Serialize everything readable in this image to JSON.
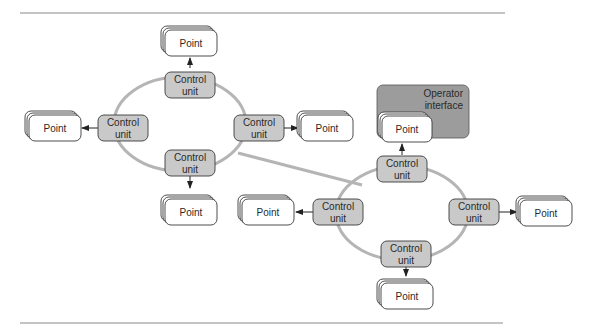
{
  "diagram": {
    "type": "network-topology",
    "control_unit_label_line1": "Control",
    "control_unit_label_line2": "unit",
    "point_label": "Point",
    "operator_interface_line1": "Operator",
    "operator_interface_line2": "interface",
    "colors": {
      "control_unit_fill": "#c9c9c9",
      "ring": "#b5b5b5",
      "operator_interface_fill": "#9c9c9c",
      "point_fill": "#ffffff",
      "outline": "#3a3a3a"
    },
    "rings": [
      {
        "id": "ring-left",
        "nodes": [
          {
            "id": "cu-left-top",
            "position": "top",
            "point_direction": "up"
          },
          {
            "id": "cu-left-left",
            "position": "left",
            "point_direction": "left"
          },
          {
            "id": "cu-left-right",
            "position": "right",
            "point_direction": "right"
          },
          {
            "id": "cu-left-bottom",
            "position": "bottom",
            "point_direction": "down"
          }
        ]
      },
      {
        "id": "ring-right",
        "nodes": [
          {
            "id": "cu-right-top",
            "position": "top",
            "point_direction": "up",
            "point_in_operator_interface": true
          },
          {
            "id": "cu-right-left",
            "position": "left",
            "point_direction": "left"
          },
          {
            "id": "cu-right-right",
            "position": "right",
            "point_direction": "right"
          },
          {
            "id": "cu-right-bottom",
            "position": "bottom",
            "point_direction": "down"
          }
        ]
      }
    ],
    "links": [
      {
        "from": "ring-left",
        "to": "ring-right"
      }
    ]
  }
}
